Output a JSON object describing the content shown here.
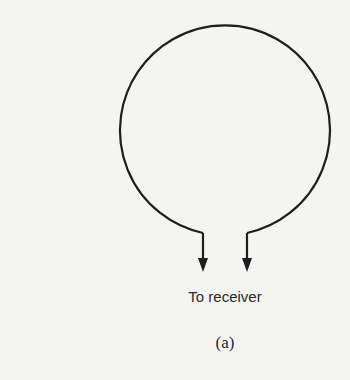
{
  "diagram": {
    "type": "loop antenna",
    "receiver_label": "To receiver",
    "caption": "(a)",
    "stroke_color": "#1e1e1e",
    "background": "#f4f4f2"
  }
}
